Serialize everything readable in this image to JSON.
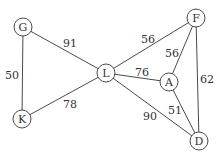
{
  "graph": {
    "type": "weighted-undirected",
    "nodes": [
      {
        "id": "G",
        "label": "G",
        "x": 23,
        "y": 27
      },
      {
        "id": "L",
        "label": "L",
        "x": 106,
        "y": 73
      },
      {
        "id": "F",
        "label": "F",
        "x": 196,
        "y": 18
      },
      {
        "id": "A",
        "label": "A",
        "x": 169,
        "y": 82
      },
      {
        "id": "K",
        "label": "K",
        "x": 22,
        "y": 119
      },
      {
        "id": "D",
        "label": "D",
        "x": 199,
        "y": 141
      }
    ],
    "edges": [
      {
        "from": "G",
        "to": "L",
        "weight": "91",
        "lx": 70,
        "ly": 43
      },
      {
        "from": "G",
        "to": "K",
        "weight": "50",
        "lx": 12,
        "ly": 75
      },
      {
        "from": "K",
        "to": "L",
        "weight": "78",
        "lx": 70,
        "ly": 104
      },
      {
        "from": "L",
        "to": "F",
        "weight": "56",
        "lx": 148,
        "ly": 39
      },
      {
        "from": "L",
        "to": "A",
        "weight": "76",
        "lx": 142,
        "ly": 72
      },
      {
        "from": "L",
        "to": "D",
        "weight": "90",
        "lx": 150,
        "ly": 116
      },
      {
        "from": "A",
        "to": "F",
        "weight": "56",
        "lx": 172,
        "ly": 53
      },
      {
        "from": "A",
        "to": "D",
        "weight": "51",
        "lx": 175,
        "ly": 110
      },
      {
        "from": "F",
        "to": "D",
        "weight": "62",
        "lx": 207,
        "ly": 79
      }
    ]
  }
}
